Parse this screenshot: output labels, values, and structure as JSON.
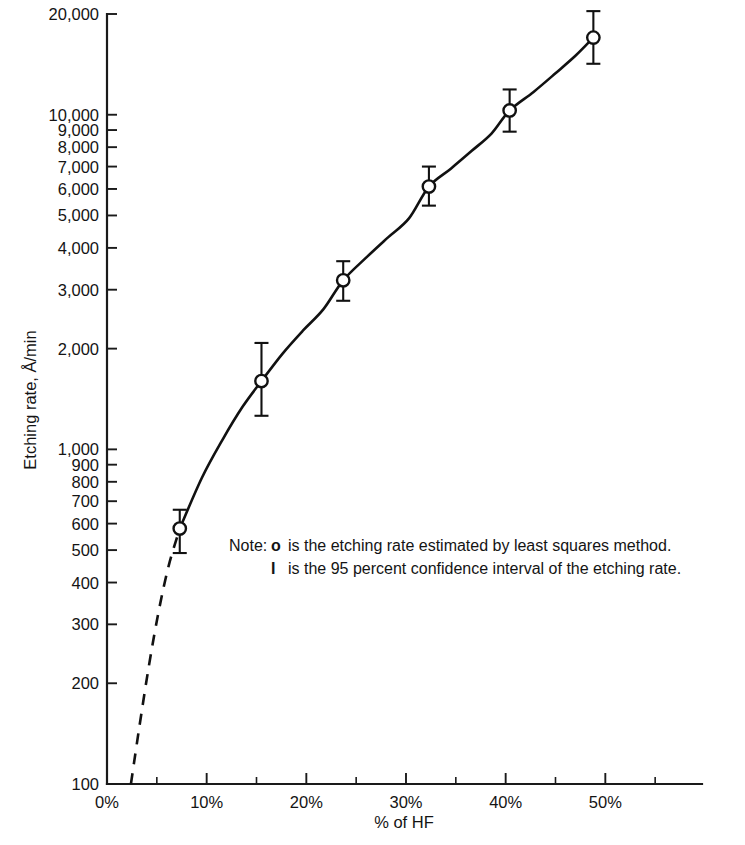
{
  "chart_data": {
    "type": "line",
    "title": "",
    "xlabel": "% of HF",
    "ylabel": "Etching rate, Å/min",
    "yscale": "log",
    "xlim": [
      0,
      59.7
    ],
    "ylim": [
      100,
      20000
    ],
    "grid": false,
    "legend": "none",
    "x": [
      7.3,
      15.5,
      23.7,
      32.3,
      40.4,
      48.8
    ],
    "values": [
      580,
      1600,
      3200,
      6100,
      10300,
      17000
    ],
    "series": [
      {
        "name": "Etching rate estimated by least squares method",
        "x": [
          7.3,
          15.5,
          23.7,
          32.3,
          40.4,
          48.8
        ],
        "values": [
          580,
          1600,
          3200,
          6100,
          10300,
          17000
        ],
        "err_low": [
          490,
          1260,
          2780,
          5350,
          8900,
          14200
        ],
        "err_high": [
          660,
          2080,
          3650,
          7000,
          11900,
          20400
        ]
      }
    ],
    "fit_curve": {
      "note": "smooth fit through the six points; dashed below the lowest measured point",
      "dashed_x": [
        2.4,
        3.2,
        4.2,
        5.2,
        6.2,
        7.3
      ],
      "dashed_values": [
        100,
        145,
        225,
        330,
        450,
        580
      ],
      "solid_x": [
        7.3,
        9.5,
        11.6,
        13.6,
        15.5,
        17.6,
        19.7,
        21.7,
        23.7,
        26.0,
        28.2,
        30.3,
        32.3,
        34.5,
        36.6,
        38.6,
        40.4,
        42.8,
        45.0,
        47.0,
        48.8
      ],
      "solid_values": [
        580,
        820,
        1070,
        1340,
        1600,
        1930,
        2270,
        2620,
        3200,
        3740,
        4300,
        4900,
        6100,
        6900,
        7800,
        8800,
        10300,
        11700,
        13300,
        15000,
        17000
      ]
    },
    "y_ticks": [
      100,
      200,
      300,
      400,
      500,
      600,
      700,
      800,
      900,
      1000,
      2000,
      3000,
      4000,
      5000,
      6000,
      7000,
      8000,
      9000,
      10000,
      20000
    ],
    "y_tick_labels": [
      "100",
      "200",
      "300",
      "400",
      "500",
      "600",
      "700",
      "800",
      "900",
      "1,000",
      "2,000",
      "3,000",
      "4,000",
      "5,000",
      "6,000",
      "7,000",
      "8,000",
      "9,000",
      "10,000",
      "20,000"
    ],
    "x_ticks": [
      0,
      10,
      20,
      30,
      40,
      50
    ],
    "x_tick_labels": [
      "0%",
      "10%",
      "20%",
      "30%",
      "40%",
      "50%"
    ],
    "x_minor_ticks": [
      5,
      15,
      25,
      35,
      45,
      55
    ],
    "annotations": [
      {
        "id": "note-line-1",
        "prefix": "Note:",
        "symbol": "o",
        "text": "is the etching rate estimated by least squares method."
      },
      {
        "id": "note-line-2",
        "prefix": "",
        "symbol": "I",
        "text": "is the 95 percent confidence interval of the etching rate."
      }
    ],
    "colors": {
      "ink": "#111111",
      "background": "#ffffff",
      "marker_fill": "#ffffff"
    }
  }
}
